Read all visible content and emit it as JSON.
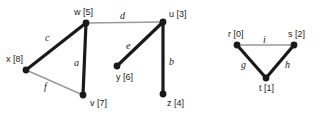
{
  "figure": {
    "background_color": "#ffffff",
    "tree_edge_color": "#1a1a1a",
    "nontree_edge_color": "#9a9a9a",
    "vertex_color": "#1a1a1a",
    "tree_edge_width": 3.2,
    "nontree_edge_width": 1.4,
    "vertex_radius": 3.4
  },
  "graphs": [
    {
      "id": "left-graph",
      "vertices": [
        {
          "id": "w",
          "label": "w [5]",
          "key": "w",
          "value": 5,
          "cx": 86,
          "cy": 23,
          "label_x": 74,
          "label_y": 8
        },
        {
          "id": "x",
          "label": "x [8]",
          "key": "x",
          "value": 8,
          "cx": 26,
          "cy": 70,
          "label_x": 6,
          "label_y": 55
        },
        {
          "id": "v",
          "label": "v [7]",
          "key": "v",
          "value": 7,
          "cx": 83,
          "cy": 95,
          "label_x": 90,
          "label_y": 99
        },
        {
          "id": "u",
          "label": "u [3]",
          "key": "u",
          "value": 3,
          "cx": 163,
          "cy": 22,
          "label_x": 169,
          "label_y": 10
        },
        {
          "id": "y",
          "label": "y [6]",
          "key": "y",
          "value": 6,
          "cx": 117,
          "cy": 66,
          "label_x": 116,
          "label_y": 73
        },
        {
          "id": "z",
          "label": "z [4]",
          "key": "z",
          "value": 4,
          "cx": 163,
          "cy": 94,
          "label_x": 167,
          "label_y": 99
        }
      ],
      "edges": [
        {
          "id": "c",
          "label": "c",
          "from": "x",
          "to": "w",
          "kind": "tree",
          "label_x": 45,
          "label_y": 33
        },
        {
          "id": "a",
          "label": "a",
          "from": "w",
          "to": "v",
          "kind": "tree",
          "label_x": 74,
          "label_y": 58
        },
        {
          "id": "f",
          "label": "f",
          "from": "x",
          "to": "v",
          "kind": "nontree",
          "label_x": 44,
          "label_y": 82
        },
        {
          "id": "d",
          "label": "d",
          "from": "w",
          "to": "u",
          "kind": "nontree",
          "label_x": 120,
          "label_y": 11
        },
        {
          "id": "e",
          "label": "e",
          "from": "y",
          "to": "u",
          "kind": "tree",
          "label_x": 126,
          "label_y": 41
        },
        {
          "id": "b",
          "label": "b",
          "from": "u",
          "to": "z",
          "kind": "tree",
          "label_x": 169,
          "label_y": 57
        }
      ]
    },
    {
      "id": "right-graph",
      "vertices": [
        {
          "id": "r",
          "label": "r [0]",
          "key": "r",
          "value": 0,
          "cx": 237,
          "cy": 45,
          "label_x": 228,
          "label_y": 30
        },
        {
          "id": "s",
          "label": "s [2]",
          "key": "s",
          "value": 2,
          "cx": 294,
          "cy": 45,
          "label_x": 288,
          "label_y": 30
        },
        {
          "id": "t",
          "label": "t [1]",
          "key": "t",
          "value": 1,
          "cx": 266,
          "cy": 78,
          "label_x": 259,
          "label_y": 84
        }
      ],
      "edges": [
        {
          "id": "i",
          "label": "i",
          "from": "r",
          "to": "s",
          "kind": "nontree",
          "label_x": 263,
          "label_y": 35
        },
        {
          "id": "g",
          "label": "g",
          "from": "r",
          "to": "t",
          "kind": "tree",
          "label_x": 241,
          "label_y": 60
        },
        {
          "id": "h",
          "label": "h",
          "from": "t",
          "to": "s",
          "kind": "tree",
          "label_x": 285,
          "label_y": 60
        }
      ]
    }
  ]
}
